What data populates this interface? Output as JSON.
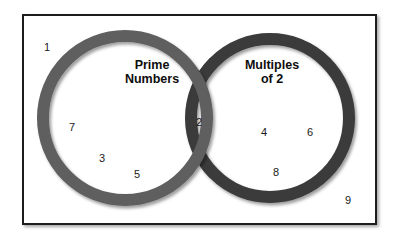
{
  "diagram": {
    "type": "venn",
    "title_left": "Prime\nNumbers",
    "title_right": "Multiples\nof 2",
    "universe_label": "",
    "colors": {
      "left_ring": "#5e5e5e",
      "right_ring": "#3a3a3a",
      "frame": "#1d1d1f",
      "background": "#ffffff",
      "number_text": "#1a1a1a",
      "label_text": "#0d0d0d"
    },
    "sets": [
      {
        "name": "Prime Numbers",
        "region": "left-only",
        "members": [
          "7",
          "3",
          "5"
        ]
      },
      {
        "name": "Multiples of 2",
        "region": "right-only",
        "members": [
          "4",
          "6",
          "8"
        ]
      },
      {
        "name": "Intersection",
        "region": "overlap",
        "members": [
          "2"
        ]
      },
      {
        "name": "Outside",
        "region": "universe-only",
        "members": [
          "1",
          "9"
        ]
      }
    ],
    "numbers": [
      {
        "value": "1",
        "x": 47,
        "y": 47,
        "region": "outside"
      },
      {
        "value": "7",
        "x": 72,
        "y": 127,
        "region": "left-only"
      },
      {
        "value": "3",
        "x": 102,
        "y": 158,
        "region": "left-only"
      },
      {
        "value": "5",
        "x": 137,
        "y": 174,
        "region": "left-only"
      },
      {
        "value": "2",
        "x": 199,
        "y": 122,
        "region": "overlap"
      },
      {
        "value": "4",
        "x": 264,
        "y": 132,
        "region": "right-only"
      },
      {
        "value": "6",
        "x": 310,
        "y": 132,
        "region": "right-only"
      },
      {
        "value": "8",
        "x": 276,
        "y": 172,
        "region": "right-only"
      },
      {
        "value": "9",
        "x": 348,
        "y": 200,
        "region": "outside"
      }
    ],
    "circles": {
      "left": {
        "cx": 125,
        "cy": 118,
        "r": 82,
        "stroke_width": 12
      },
      "right": {
        "cx": 270,
        "cy": 118,
        "r": 79,
        "stroke_width": 12
      }
    },
    "label_positions": {
      "left": {
        "x": 152,
        "y": 72
      },
      "right": {
        "x": 272,
        "y": 72
      }
    }
  }
}
